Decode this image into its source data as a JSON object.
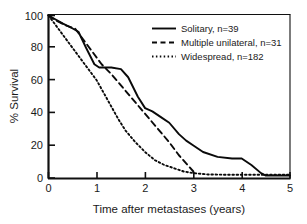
{
  "chart_data": {
    "type": "line",
    "title": "",
    "xlabel": "Time after metastases (years)",
    "ylabel": "% Survival",
    "xlim": [
      0,
      5
    ],
    "ylim": [
      0,
      100
    ],
    "xticks": [
      "0",
      "1",
      "2",
      "3",
      "4",
      "5"
    ],
    "yticks": [
      "0",
      "20",
      "40",
      "60",
      "80",
      "100"
    ],
    "xtick_values": [
      0,
      1,
      2,
      3,
      4,
      5
    ],
    "ytick_values": [
      0,
      20,
      40,
      60,
      80,
      100
    ],
    "grid": false,
    "legend_position": "top-right-inside",
    "series": [
      {
        "name": "Solitary, n=39",
        "label": "Solitary",
        "n": 39,
        "style": "solid",
        "x": [
          0,
          0.12,
          0.3,
          0.5,
          0.62,
          0.78,
          0.95,
          1.05,
          1.3,
          1.5,
          1.65,
          1.85,
          2.0,
          2.15,
          2.35,
          2.5,
          2.7,
          2.85,
          3.0,
          3.2,
          3.5,
          3.8,
          4.0,
          4.2,
          4.4,
          4.5,
          4.75,
          5.0
        ],
        "y": [
          100,
          98,
          95,
          92,
          90,
          80,
          70,
          68,
          68,
          67,
          62,
          50,
          43,
          41,
          37,
          34,
          27,
          23,
          20,
          16,
          13,
          12,
          12,
          8,
          3,
          1.5,
          1.5,
          1.5
        ]
      },
      {
        "name": "Multiple unilateral, n=31",
        "label": "Multiple unilateral",
        "n": 31,
        "style": "dashed",
        "x": [
          0,
          0.15,
          0.35,
          0.55,
          0.7,
          0.9,
          1.1,
          1.3,
          1.5,
          1.7,
          1.9,
          2.1,
          2.3,
          2.5,
          2.7,
          2.85,
          3.0
        ],
        "y": [
          100,
          97,
          94,
          92,
          86,
          78,
          70,
          64,
          57,
          50,
          43,
          36,
          29,
          22,
          14,
          9,
          4
        ]
      },
      {
        "name": "Widespread, n=182",
        "label": "Widespread",
        "n": 182,
        "style": "dotted",
        "x": [
          0,
          0.1,
          0.25,
          0.45,
          0.65,
          0.85,
          1.0,
          1.15,
          1.3,
          1.45,
          1.6,
          1.8,
          2.0,
          2.2,
          2.4,
          2.6,
          2.8,
          3.0,
          3.3,
          3.7,
          4.1,
          4.5,
          5.0
        ],
        "y": [
          100,
          96,
          90,
          82,
          74,
          66,
          60,
          52,
          44,
          36,
          29,
          22,
          16,
          11,
          8,
          6,
          4,
          3,
          2.2,
          2.0,
          2.0,
          2.0,
          2.0
        ]
      }
    ]
  },
  "axes": {
    "x_label": "Time after metastases (years)",
    "y_label": "% Survival"
  },
  "legend": {
    "entries": [
      {
        "label": "Solitary, n=39",
        "style": "solid"
      },
      {
        "label": "Multiple unilateral, n=31",
        "style": "dashed"
      },
      {
        "label": "Widespread, n=182",
        "style": "dotted"
      }
    ]
  },
  "colors": {
    "ink": "#0a0a0a",
    "background": "#ffffff"
  }
}
